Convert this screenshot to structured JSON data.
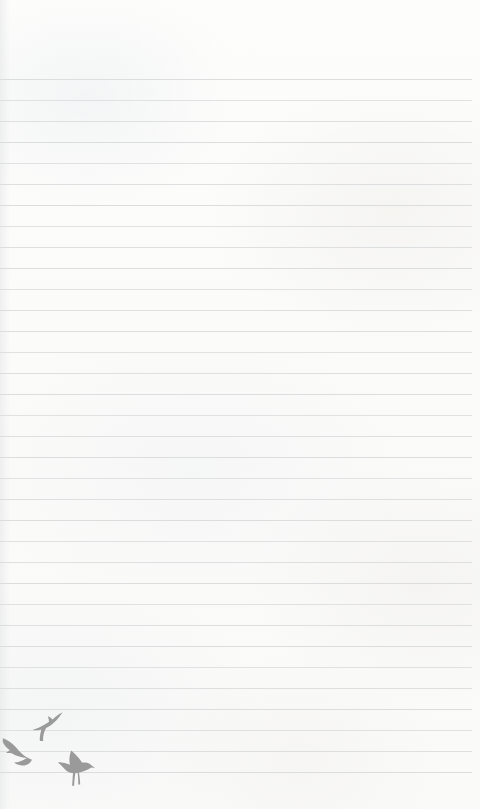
{
  "page": {
    "width": 480,
    "height": 809,
    "background_color": "#fcfcfb",
    "content_text": ""
  },
  "ruling": {
    "line_color": "#d9dbdc",
    "line_thickness_px": 1,
    "line_spacing_px": 21,
    "first_line_y": 79,
    "last_line_y": 772,
    "line_count": 34,
    "line_left_x": 0,
    "line_right_x": 472,
    "top_margin_px": 79,
    "bottom_margin_px": 37,
    "right_margin_px": 8
  },
  "decoration": {
    "motif_name": "flying-birds",
    "color": "#9a9a9a",
    "count": 3,
    "position": "bottom-left",
    "birds": [
      {
        "name": "bird-upper-right",
        "pose": "flying-up-right",
        "x": 31,
        "y": 711,
        "width": 33,
        "height": 30
      },
      {
        "name": "bird-left",
        "pose": "gliding-down-left",
        "x": 2,
        "y": 738,
        "width": 30,
        "height": 28
      },
      {
        "name": "bird-lower-perched",
        "pose": "landing-wings-up",
        "x": 58,
        "y": 750,
        "width": 38,
        "height": 36
      }
    ]
  }
}
